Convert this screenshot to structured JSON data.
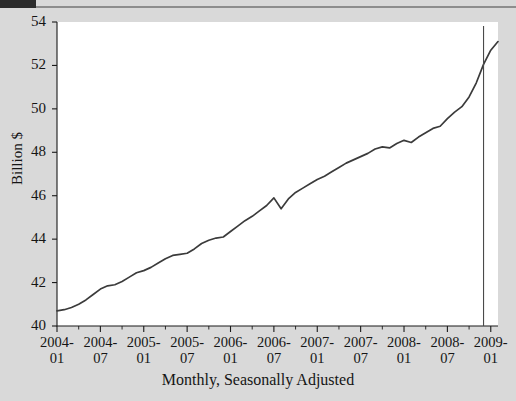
{
  "chart_data": {
    "type": "line",
    "title": "",
    "xlabel": "Monthly, Seasonally Adjusted",
    "ylabel": "Billion $",
    "ylim": [
      40,
      54
    ],
    "yticks": [
      40,
      42,
      44,
      46,
      48,
      50,
      52,
      54
    ],
    "xticks": [
      "2004-01",
      "2004-07",
      "2005-01",
      "2005-07",
      "2006-01",
      "2006-07",
      "2007-01",
      "2007-07",
      "2008-01",
      "2008-07",
      "2009-01"
    ],
    "xtick_lines": [
      [
        "2004-",
        "01"
      ],
      [
        "2004-",
        "07"
      ],
      [
        "2005-",
        "01"
      ],
      [
        "2005-",
        "07"
      ],
      [
        "2006-",
        "01"
      ],
      [
        "2006-",
        "07"
      ],
      [
        "2007-",
        "01"
      ],
      [
        "2007-",
        "07"
      ],
      [
        "2008-",
        "01"
      ],
      [
        "2008-",
        "07"
      ],
      [
        "2009-",
        "01"
      ]
    ],
    "grid": false,
    "legend": false,
    "line_color": "#3b3b3b",
    "plot_bg": "#ffffff",
    "figure_bg": "#d9d9d9",
    "annotations": [
      {
        "type": "vertical-line",
        "x": "2008-12",
        "color": "#4a4a4a"
      }
    ],
    "x": [
      "2004-01",
      "2004-02",
      "2004-03",
      "2004-04",
      "2004-05",
      "2004-06",
      "2004-07",
      "2004-08",
      "2004-09",
      "2004-10",
      "2004-11",
      "2004-12",
      "2005-01",
      "2005-02",
      "2005-03",
      "2005-04",
      "2005-05",
      "2005-06",
      "2005-07",
      "2005-08",
      "2005-09",
      "2005-10",
      "2005-11",
      "2005-12",
      "2006-01",
      "2006-02",
      "2006-03",
      "2006-04",
      "2006-05",
      "2006-06",
      "2006-07",
      "2006-08",
      "2006-09",
      "2006-10",
      "2006-11",
      "2006-12",
      "2007-01",
      "2007-02",
      "2007-03",
      "2007-04",
      "2007-05",
      "2007-06",
      "2007-07",
      "2007-08",
      "2007-09",
      "2007-10",
      "2007-11",
      "2007-12",
      "2008-01",
      "2008-02",
      "2008-03",
      "2008-04",
      "2008-05",
      "2008-06",
      "2008-07",
      "2008-08",
      "2008-09",
      "2008-10",
      "2008-11",
      "2008-12",
      "2009-01",
      "2009-02"
    ],
    "values": [
      40.7,
      40.75,
      40.85,
      41.0,
      41.2,
      41.45,
      41.7,
      41.85,
      41.9,
      42.05,
      42.25,
      42.45,
      42.55,
      42.7,
      42.9,
      43.1,
      43.25,
      43.3,
      43.35,
      43.55,
      43.8,
      43.95,
      44.05,
      44.1,
      44.35,
      44.6,
      44.85,
      45.05,
      45.3,
      45.55,
      45.9,
      45.4,
      45.85,
      46.15,
      46.35,
      46.55,
      46.75,
      46.9,
      47.1,
      47.3,
      47.5,
      47.65,
      47.8,
      47.95,
      48.15,
      48.25,
      48.2,
      48.4,
      48.55,
      48.45,
      48.7,
      48.9,
      49.1,
      49.2,
      49.55,
      49.85,
      50.1,
      50.55,
      51.2,
      52.05,
      52.7,
      53.1
    ],
    "series": [
      {
        "name": "Billion $",
        "values": [
          40.7,
          40.75,
          40.85,
          41.0,
          41.2,
          41.45,
          41.7,
          41.85,
          41.9,
          42.05,
          42.25,
          42.45,
          42.55,
          42.7,
          42.9,
          43.1,
          43.25,
          43.3,
          43.35,
          43.55,
          43.8,
          43.95,
          44.05,
          44.1,
          44.35,
          44.6,
          44.85,
          45.05,
          45.3,
          45.55,
          45.9,
          45.4,
          45.85,
          46.15,
          46.35,
          46.55,
          46.75,
          46.9,
          47.1,
          47.3,
          47.5,
          47.65,
          47.8,
          47.95,
          48.15,
          48.25,
          48.2,
          48.4,
          48.55,
          48.45,
          48.7,
          48.9,
          49.1,
          49.2,
          49.55,
          49.85,
          50.1,
          50.55,
          51.2,
          52.05,
          52.7,
          53.1
        ]
      }
    ]
  }
}
